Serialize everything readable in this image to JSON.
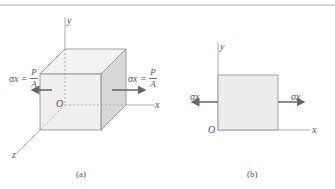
{
  "figure_a": {
    "caption": "(a)",
    "axes": {
      "x": "x",
      "y": "y",
      "z": "z",
      "origin": "O"
    },
    "left_stress": {
      "symbol": "σx =",
      "numerator": "P",
      "denominator": "A"
    },
    "right_stress": {
      "symbol": "σx =",
      "numerator": "P",
      "denominator": "A"
    }
  },
  "figure_b": {
    "caption": "(b)",
    "axes": {
      "x": "x",
      "y": "y",
      "origin": "O"
    },
    "left_stress": "σx",
    "right_stress": "σx"
  },
  "colors": {
    "face_front": "#ececec",
    "face_side": "#d6d6d6",
    "face_top": "#f2f2f2",
    "line": "#8a8a8a",
    "arrow": "#666666"
  }
}
